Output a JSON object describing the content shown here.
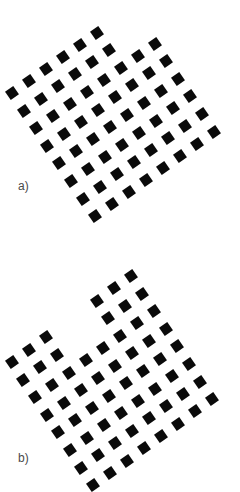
{
  "figures": [
    {
      "label": "a)",
      "square_color": "#0a0a0a",
      "grid": {
        "rows": 8,
        "cols": 8,
        "origin": [
          12,
          93
        ],
        "u_step": [
          17,
          -12.1
        ],
        "v_step": [
          11.8,
          17.6
        ],
        "missing_cells": [
          [
            6,
            0
          ],
          [
            7,
            0
          ],
          [
            6,
            1
          ],
          [
            7,
            1
          ]
        ],
        "square_count": 60
      }
    },
    {
      "label": "b)",
      "square_color": "#0a0a0a",
      "grid": {
        "rows": 8,
        "cols": 8,
        "origin": [
          11.7,
          362
        ],
        "u_step": [
          17,
          -12.3
        ],
        "v_step": [
          11.6,
          17.6
        ],
        "missing_cells": [
          [
            3,
            0
          ],
          [
            4,
            0
          ],
          [
            3,
            1
          ],
          [
            4,
            1
          ]
        ],
        "square_count": 60
      }
    }
  ],
  "label_color": "#4a4a4a",
  "rotation_deg": -35
}
